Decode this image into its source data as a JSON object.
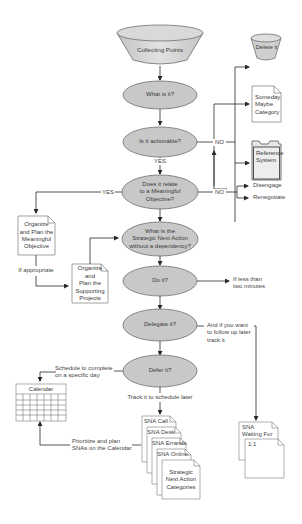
{
  "diagram": {
    "colors": {
      "decision_fill": "#c8c8c8",
      "decision_stroke": "#6e6e6e",
      "line": "#2a2a2a",
      "doc_fill": "#ffffff",
      "doc_stroke": "#7a7a7a"
    },
    "nodes": {
      "collecting_points": "Collecting Points",
      "what_is_it": "What is it?",
      "is_it_actionable": "Is it actionable?",
      "meaningful_objective_q": [
        "Does it relate",
        "to a Meaningful",
        "Objective?"
      ],
      "strategic_next_action_q": [
        "What is the",
        "Strategic Next Action",
        "without a dependency?"
      ],
      "do_it": "Do it?",
      "delegate_it": "Delegate it?",
      "defer_it": "Defer it?",
      "delete_it": "Delete it",
      "someday_maybe": [
        "Someday",
        "Maybe",
        "Category"
      ],
      "reference_system": [
        "Reference",
        "System"
      ],
      "disengage": "Disengage",
      "renegotiate": "Renegotiate",
      "organize_objective": [
        "Organize",
        "and Plan the",
        "Meaningful",
        "Objective"
      ],
      "organize_projects": [
        "Organize and",
        "Plan the",
        "Supporting",
        "Projects"
      ],
      "calendar": "Calendar",
      "sna_stack": [
        "SNA Call",
        "SNA Desk",
        "SNA Errands",
        "SNA Online"
      ],
      "sna_categories": [
        "Strategic",
        "Next Action",
        "Categories"
      ],
      "sna_waiting": [
        "SNA",
        "Waiting For"
      ],
      "one_on_one": "1:1"
    },
    "edge_labels": {
      "yes_actionable": "YES",
      "no_actionable": "NO",
      "yes_objective": "YES",
      "no_objective": "NO",
      "if_appropriate": "If appropriate",
      "if_less_than": [
        "If less than",
        "two minutes"
      ],
      "follow_up": [
        "And if you want",
        "to follow up later",
        "track it"
      ],
      "schedule": [
        "Schedule to complete",
        "on a specific day"
      ],
      "track_later": "Track it to schedule later",
      "prioritize": [
        "Prioritize and plan",
        "SNAs on the Calendar"
      ]
    }
  }
}
